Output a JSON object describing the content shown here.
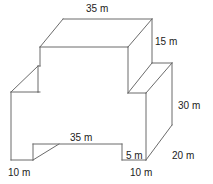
{
  "figure": {
    "kind": "geometry-diagram",
    "stroke_color": "#6b6b6b",
    "stroke_width": 1,
    "background_color": "#ffffff",
    "text_color": "#222222",
    "unit": "m",
    "labels": [
      {
        "id": "top-width",
        "text": "35 m",
        "x": 86,
        "y": 3,
        "role": "top face width"
      },
      {
        "id": "upper-depth",
        "text": "15 m",
        "x": 155,
        "y": 36,
        "role": "upper step height"
      },
      {
        "id": "right-height",
        "text": "30 m",
        "x": 178,
        "y": 100,
        "role": "right face height"
      },
      {
        "id": "bottom-diagonal",
        "text": "20 m",
        "x": 172,
        "y": 150,
        "role": "depth along base diagonal"
      },
      {
        "id": "front-width",
        "text": "35 m",
        "x": 70,
        "y": 132,
        "role": "front face width"
      },
      {
        "id": "right-notch",
        "text": "5 m",
        "x": 126,
        "y": 150,
        "role": "small right notch width"
      },
      {
        "id": "bottom-left-leg",
        "text": "10 m",
        "x": 8,
        "y": 167,
        "role": "left leg width"
      },
      {
        "id": "bottom-right-leg",
        "text": "10 m",
        "x": 130,
        "y": 167,
        "role": "right leg width"
      }
    ],
    "geometry": {
      "polylines": [
        {
          "id": "top-face-back-edge",
          "points": "63,19 152,19"
        },
        {
          "id": "top-face-left-diagonal",
          "points": "63,19 40,47"
        },
        {
          "id": "top-face-front-edge",
          "points": "40,47 128,47"
        },
        {
          "id": "top-face-right-diagonal",
          "points": "152,19 128,47"
        },
        {
          "id": "upper-right-vertical",
          "points": "152,19 152,63"
        },
        {
          "id": "upper-front-right-vertical",
          "points": "128,47 128,93"
        },
        {
          "id": "mid-step-diagonal-right",
          "points": "152,63 128,93"
        },
        {
          "id": "mid-step-top-edge",
          "points": "152,63 172,63"
        },
        {
          "id": "mid-step-right-vertical",
          "points": "172,63 172,125"
        },
        {
          "id": "mid-step-inner-diagonal",
          "points": "172,63 146,93"
        },
        {
          "id": "front-face-right-vertical",
          "points": "146,93 146,160"
        },
        {
          "id": "front-upper-right-edge",
          "points": "128,93 146,93"
        },
        {
          "id": "left-step-diagonal",
          "points": "11,92 38,66"
        },
        {
          "id": "left-step-vertical",
          "points": "38,66 38,92"
        },
        {
          "id": "left-step-top-edge",
          "points": "38,66 40,66"
        },
        {
          "id": "left-upper-edge",
          "points": "38,92 11,92"
        },
        {
          "id": "front-face-left-vertical",
          "points": "11,92 11,160"
        },
        {
          "id": "front-face-upper-edge",
          "points": "38,92 40,92"
        },
        {
          "id": "left-leg-bottom",
          "points": "11,160 33,160"
        },
        {
          "id": "left-notch-vertical",
          "points": "33,160 33,144"
        },
        {
          "id": "left-notch-top",
          "points": "33,144 122,144"
        },
        {
          "id": "left-notch-diagonal",
          "points": "33,160 59,144"
        },
        {
          "id": "right-notch-vertical",
          "points": "122,144 122,160"
        },
        {
          "id": "right-leg-bottom",
          "points": "122,160 146,160"
        },
        {
          "id": "base-right-diagonal",
          "points": "146,160 172,125"
        },
        {
          "id": "upper-left-vertical-stub",
          "points": "40,47 40,66"
        }
      ]
    }
  }
}
